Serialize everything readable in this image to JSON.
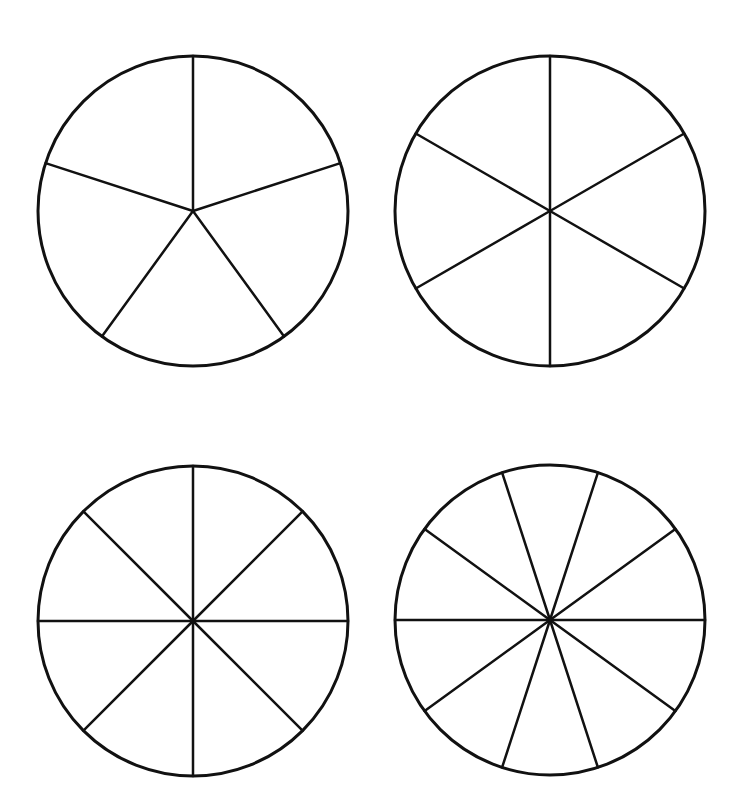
{
  "diagram": {
    "stroke_color": "#111111",
    "background": "#ffffff",
    "circles": [
      {
        "name": "circle-fifths",
        "sections": 5,
        "cx": 193,
        "cy": 211,
        "r": 155,
        "start_angle_deg": -90
      },
      {
        "name": "circle-sixths",
        "sections": 6,
        "cx": 550,
        "cy": 211,
        "r": 155,
        "start_angle_deg": -90
      },
      {
        "name": "circle-eighths",
        "sections": 8,
        "cx": 193,
        "cy": 621,
        "r": 155,
        "start_angle_deg": -90
      },
      {
        "name": "circle-tenths",
        "sections": 10,
        "cx": 550,
        "cy": 620,
        "r": 155,
        "start_angle_deg": 0
      }
    ]
  }
}
